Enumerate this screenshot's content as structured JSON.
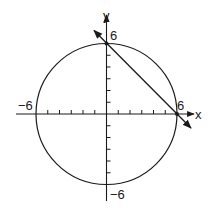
{
  "figure": {
    "type": "coordinate-plane",
    "axes": {
      "x_label": "x",
      "y_label": "y",
      "range": [
        -6,
        6
      ],
      "tick_step": 1
    },
    "labels": {
      "x_pos": "6",
      "x_neg": "−6",
      "y_pos": "6",
      "y_neg": "−6"
    },
    "circle": {
      "center": [
        0,
        0
      ],
      "radius": 6
    },
    "line": {
      "through": [
        [
          0,
          6
        ],
        [
          6,
          0
        ]
      ],
      "equation": "x + y = 6"
    },
    "intersection_points": [
      [
        0,
        6
      ],
      [
        6,
        0
      ]
    ],
    "colors": {
      "stroke": "#1a1a1a",
      "background": "#ffffff"
    }
  }
}
